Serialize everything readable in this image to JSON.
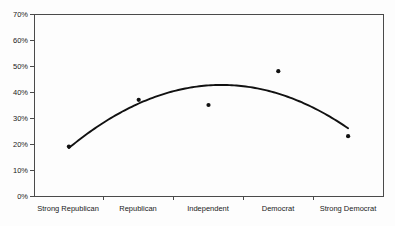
{
  "chart_data": {
    "type": "scatter",
    "title": "",
    "subtitle": "",
    "xlabel": "",
    "ylabel": "",
    "categories": [
      "Strong Republican",
      "Republican",
      "Independent",
      "Democrat",
      "Strong Democrat"
    ],
    "values": [
      19,
      37,
      35,
      48,
      23
    ],
    "series": [
      {
        "name": "Observed percentage",
        "values": [
          19,
          37,
          35,
          48,
          23
        ]
      },
      {
        "name": "Fitted quadratic curve",
        "values": [
          19,
          35,
          43,
          41,
          26
        ]
      }
    ],
    "ylim": [
      0,
      70
    ],
    "ytick_values": [
      0,
      10,
      20,
      30,
      40,
      50,
      60,
      70
    ],
    "ytick_labels": [
      "0%",
      "10%",
      "20%",
      "30%",
      "40%",
      "50%",
      "60%",
      "70%"
    ],
    "grid": false,
    "legend": "none",
    "point_color": "#111111",
    "curve_color": "#111111",
    "frame_color": "#4a4a4a",
    "background_color": "#fdfdfd",
    "annotations": []
  },
  "axes": {
    "y_axis_name": "percentage-axis",
    "x_axis_name": "party-identification-axis"
  }
}
